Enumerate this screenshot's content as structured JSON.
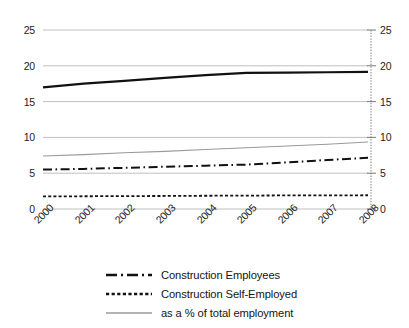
{
  "chart_data": {
    "type": "line",
    "title": "",
    "subtitle": "",
    "xlabel": "",
    "ylabel": "",
    "categories": [
      "2000",
      "2001",
      "2002",
      "2003",
      "2004",
      "2005",
      "2006",
      "2007",
      "2008"
    ],
    "x": [
      2000,
      2001,
      2002,
      2003,
      2004,
      2005,
      2006,
      2007,
      2008
    ],
    "ylim": [
      0,
      25
    ],
    "y_ticks": [
      0,
      5,
      10,
      15,
      20,
      25
    ],
    "y_ticks_right": [
      0,
      5,
      10,
      15,
      20,
      25
    ],
    "grid": "horizontal",
    "legend_position": "bottom",
    "dual_axis": true,
    "series": [
      {
        "name": "Construction Total",
        "style": "solid",
        "color": "#111111",
        "width": 2.2,
        "in_legend": false,
        "values": [
          17.0,
          17.5,
          17.9,
          18.3,
          18.7,
          19.0,
          19.05,
          19.1,
          19.15
        ]
      },
      {
        "name": "Construction Employees",
        "style": "dash-dot",
        "color": "#111111",
        "width": 2.0,
        "in_legend": true,
        "values": [
          5.5,
          5.6,
          5.75,
          5.9,
          6.05,
          6.2,
          6.5,
          6.85,
          7.15
        ]
      },
      {
        "name": "Construction Self-Employed",
        "style": "dotted",
        "color": "#111111",
        "width": 1.8,
        "in_legend": true,
        "values": [
          1.75,
          1.78,
          1.8,
          1.82,
          1.85,
          1.87,
          1.9,
          1.9,
          1.92
        ]
      },
      {
        "name": "as a % of total employment",
        "style": "solid-thin",
        "color": "#9a9a9a",
        "width": 1.1,
        "in_legend": true,
        "values": [
          7.4,
          7.6,
          7.85,
          8.05,
          8.3,
          8.55,
          8.8,
          9.05,
          9.35
        ]
      }
    ]
  },
  "axes": {
    "left": {
      "name": "left-value-axis",
      "ticks": [
        "25",
        "20",
        "15",
        "10",
        "5",
        "0"
      ]
    },
    "right": {
      "name": "right-value-axis",
      "ticks": [
        "25",
        "20",
        "15",
        "10",
        "5",
        "0"
      ]
    },
    "bottom": {
      "name": "year-axis",
      "ticks": [
        "2000",
        "2001",
        "2002",
        "2003",
        "2004",
        "2005",
        "2006",
        "2007",
        "2008"
      ]
    }
  },
  "legend": {
    "items": [
      {
        "label": "Construction Employees",
        "swatch": "dash-dot-line-swatch"
      },
      {
        "label": "Construction Self-Employed",
        "swatch": "dotted-line-swatch"
      },
      {
        "label": "as a % of total employment",
        "swatch": "gray-solid-line-swatch"
      }
    ]
  },
  "colors": {
    "series_dark": "#111111",
    "series_gray": "#9a9a9a",
    "gridline": "#b8b8b8",
    "axis": "#5a5a5a",
    "text": "#1a1a1a",
    "background": "#ffffff"
  }
}
